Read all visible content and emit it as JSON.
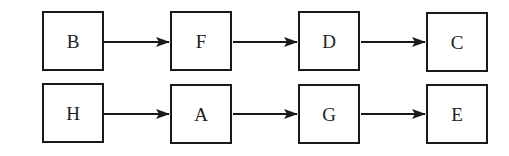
{
  "diagram": {
    "type": "flow",
    "colors": {
      "stroke": "#1a1a1a",
      "text": "#222222",
      "background": "#ffffff"
    },
    "rows": [
      {
        "nodes": [
          {
            "id": "B",
            "label": "B"
          },
          {
            "id": "F",
            "label": "F"
          },
          {
            "id": "D",
            "label": "D"
          },
          {
            "id": "C",
            "label": "C"
          }
        ],
        "edges": [
          {
            "from": "B",
            "to": "F"
          },
          {
            "from": "F",
            "to": "D"
          },
          {
            "from": "D",
            "to": "C"
          }
        ]
      },
      {
        "nodes": [
          {
            "id": "H",
            "label": "H"
          },
          {
            "id": "A",
            "label": "A"
          },
          {
            "id": "G",
            "label": "G"
          },
          {
            "id": "E",
            "label": "E"
          }
        ],
        "edges": [
          {
            "from": "H",
            "to": "A"
          },
          {
            "from": "A",
            "to": "G"
          },
          {
            "from": "G",
            "to": "E"
          }
        ]
      }
    ]
  }
}
